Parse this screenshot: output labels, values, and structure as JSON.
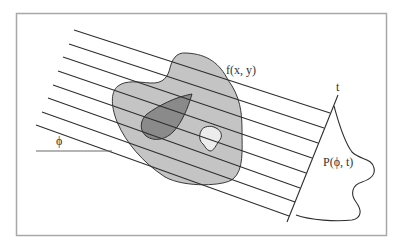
{
  "figure": {
    "labels": {
      "object": "f(x, y)",
      "detector_axis": "t",
      "angle": "ϕ",
      "projection": "P(ϕ, t)"
    },
    "colors": {
      "frame": "#a8a8a8",
      "line": "#2e2e2e",
      "object_fill": "#c4c4c4",
      "inner_dark_fill": "#8a8a8a",
      "hole_fill": "#ececec",
      "background": "#ffffff"
    },
    "ray_count": 8
  }
}
